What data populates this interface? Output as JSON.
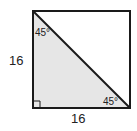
{
  "diagram": {
    "shape": "square with diagonal",
    "side_left_label": "16",
    "side_bottom_label": "16",
    "angle_top_label": "45°",
    "angle_bottom_right_label": "45°",
    "right_angle_marker": true,
    "colors": {
      "stroke": "#1a1a1a",
      "shaded_triangle": "#e6e6e6",
      "background": "#ffffff"
    }
  }
}
